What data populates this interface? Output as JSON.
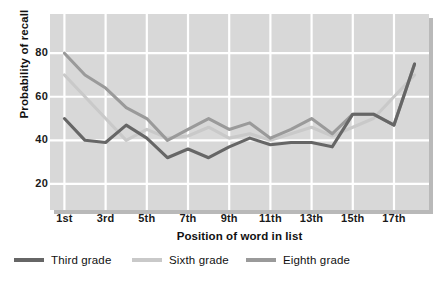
{
  "chart_data": {
    "type": "line",
    "title": "",
    "xlabel": "Position of word in list",
    "ylabel": "Probability of recall",
    "x": [
      1,
      2,
      3,
      4,
      5,
      6,
      7,
      8,
      9,
      10,
      11,
      12,
      13,
      14,
      15,
      16,
      17,
      18
    ],
    "xtick_positions": [
      1,
      3,
      5,
      7,
      9,
      11,
      13,
      15,
      17
    ],
    "xtick_labels": [
      "1st",
      "3rd",
      "5th",
      "7th",
      "9th",
      "11th",
      "13th",
      "15th",
      "17th"
    ],
    "ytick_values": [
      20,
      40,
      60,
      80
    ],
    "ytick_labels": [
      "20",
      "40",
      "60",
      "80"
    ],
    "ylim": [
      8,
      98
    ],
    "xlim": [
      0.3,
      18.7
    ],
    "grid": true,
    "grid_color": "#ffffff",
    "plot_background": "#d8d8d8",
    "legend_position": "below",
    "series": [
      {
        "name": "Third grade",
        "color": "#666666",
        "values": [
          50,
          40,
          39,
          47,
          41,
          32,
          36,
          32,
          37,
          41,
          38,
          39,
          39,
          37,
          52,
          52,
          47,
          75
        ]
      },
      {
        "name": "Sixth grade",
        "color": "#c9c9c9",
        "values": [
          70,
          60,
          50,
          40,
          45,
          41,
          42,
          46,
          41,
          43,
          40,
          43,
          46,
          42,
          46,
          50,
          60,
          70
        ]
      },
      {
        "name": "Eighth grade",
        "color": "#9a9a9a",
        "values": [
          80,
          70,
          64,
          55,
          50,
          40,
          45,
          50,
          45,
          48,
          41,
          45,
          50,
          43,
          52,
          52,
          47,
          75
        ]
      }
    ]
  },
  "axes": {
    "ylabel": "Probability of recall",
    "xlabel": "Position of word in list",
    "ytick_labels": [
      "80",
      "60",
      "40",
      "20"
    ],
    "xtick_labels": [
      "1st",
      "3rd",
      "5th",
      "7th",
      "9th",
      "11th",
      "13th",
      "15th",
      "17th"
    ]
  },
  "legend": {
    "items": [
      {
        "label": "Third grade",
        "color": "#666666"
      },
      {
        "label": "Sixth grade",
        "color": "#c9c9c9"
      },
      {
        "label": "Eighth grade",
        "color": "#9a9a9a"
      }
    ]
  }
}
